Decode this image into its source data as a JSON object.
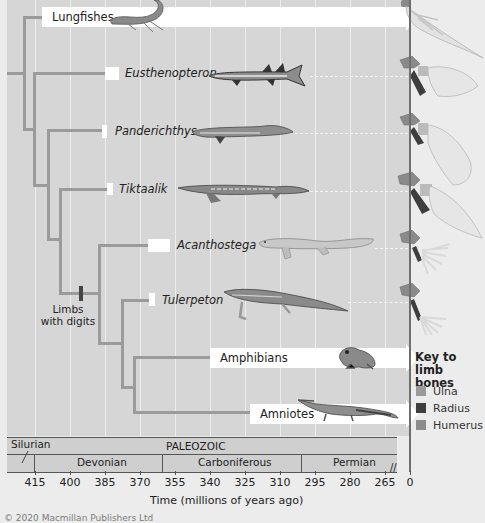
{
  "figure": {
    "taxa": [
      {
        "name": "Lungfishes",
        "italic": false,
        "arrow": true
      },
      {
        "name": "Eusthenopteron",
        "italic": true,
        "arrow": false
      },
      {
        "name": "Panderichthys",
        "italic": true,
        "arrow": false
      },
      {
        "name": "Tiktaalik",
        "italic": true,
        "arrow": false
      },
      {
        "name": "Acanthostega",
        "italic": true,
        "arrow": false
      },
      {
        "name": "Tulerpeton",
        "italic": true,
        "arrow": false
      },
      {
        "name": "Amphibians",
        "italic": false,
        "arrow": true
      },
      {
        "name": "Amniotes",
        "italic": false,
        "arrow": true
      }
    ],
    "character_mark": "Limbs with digits",
    "character_mark_lines": [
      "Limbs",
      "with digits"
    ],
    "key": {
      "title_lines": [
        "Key to",
        "limb bones"
      ],
      "items": [
        {
          "label": "Ulna",
          "color": "#9a9a9a"
        },
        {
          "label": "Radius",
          "color": "#3e3e3e"
        },
        {
          "label": "Humerus",
          "color": "#8c8c8c"
        }
      ]
    },
    "timescale": {
      "era": "PALEOZOIC",
      "earlier_period": "Silurian",
      "periods": [
        "Devonian",
        "Carboniferous",
        "Permian"
      ],
      "ticks": [
        "415",
        "400",
        "385",
        "370",
        "355",
        "340",
        "325",
        "310",
        "295",
        "280",
        "265",
        "0"
      ],
      "axis_title": "Time (millions of years ago)",
      "break_symbol": "//"
    },
    "copyright": "© 2020 Macmillan Publishers Ltd"
  },
  "colors": {
    "plot_background": "#d6d6d6",
    "branch": "#9b9b9b",
    "page_background": "#ececec"
  }
}
